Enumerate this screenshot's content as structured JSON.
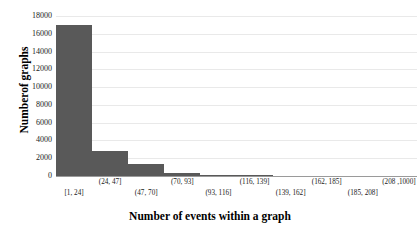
{
  "chart_data": {
    "type": "bar",
    "title": "",
    "xlabel": "Number of events within a graph",
    "ylabel": "Numberof graphs",
    "categories": [
      "[1, 24]",
      "(24, 47]",
      "(47, 70]",
      "(70, 93]",
      "(93, 116]",
      "(116, 139]",
      "(139, 162]",
      "(162, 185]",
      "(185, 208]",
      "(208 ,1000]"
    ],
    "values": [
      17000,
      2800,
      1300,
      350,
      120,
      60,
      30,
      20,
      10,
      30
    ],
    "ylim": [
      0,
      18000
    ],
    "yticks": [
      18000,
      16000,
      14000,
      12000,
      10000,
      8000,
      6000,
      4000,
      2000,
      0
    ],
    "grid": true,
    "legend": "none",
    "bar_color": "#595959",
    "grid_color": "#e9e9e9",
    "axis_color": "#9a9a9a"
  }
}
